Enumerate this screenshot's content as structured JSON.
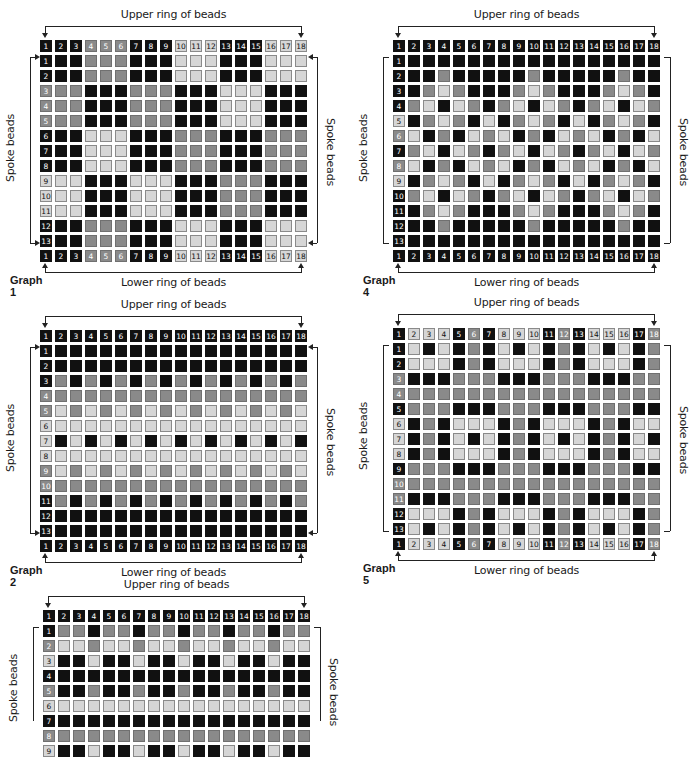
{
  "labels": {
    "upper": "Upper ring of beads",
    "lower": "Lower ring of beads",
    "spoke": "Spoke beads"
  },
  "colors": {
    "B": "#111111",
    "G": "#8a8a8a",
    "L": "#d6d6d6"
  },
  "graphs": [
    {
      "id": "graph1",
      "caption": "Graph 1",
      "x": 40,
      "y": 0,
      "style": "arrows",
      "header": "BBBGGGBBBLLLBBBLLL",
      "rows": [
        "BBBGGGBBBLLLBBBLLL",
        "BBBGGGBBBLLLBBBLLL",
        "GGGBBBGGGBBBLLLBBB",
        "GGGBBBGGGBBBLLLBBB",
        "GGGBBBGGGBBBLLLBBB",
        "BBBLLLBBBGGGBBBGGG",
        "BBBLLLBBBGGGBBBGGG",
        "BBBLLLBBBGGGBBBGGG",
        "LLLBBBLLLBBBGGGBBB",
        "LLLBBBLLLBBBGGGBBB",
        "LLLBBBLLLBBBGGGBBB",
        "BBBGGGBBBLLLBBBLLL",
        "BBBGGGBBBLLLBBBLLL"
      ],
      "footer": "BBBGGGBBBLLLBBBLLL"
    },
    {
      "id": "graph4",
      "caption": "Graph 4",
      "x": 393,
      "y": 0,
      "style": "brackets",
      "header": "BBBBBBBBBBBBBBBBBB",
      "rows": [
        "BBBBBBBBBBBBBBBBBB",
        "BBBGBBBBBGBBBBBGBB",
        "BBGLGBBBGLGBBBGLGB",
        "BGLBLGBGLBLGBGLBLG",
        "LBGLGBLBGLGBLBGLGB",
        "GLBGBLGLBGBLGLBGBL",
        "BGLBLGBGLBLGBGLBLG",
        "GLBGBLGLBGBLGLBGBL",
        "LBGLGBLBGLGBLBGLGB",
        "BGLBLGBGLBLGBGLBLG",
        "BBGLGBBBGLGBBBGLGB",
        "BBBGBBBBBGBBBBBGBB",
        "BBBBBBBBBBBBBBBBBB"
      ],
      "footer": "BBBBBBBBBBBBBBBBBB"
    },
    {
      "id": "graph2",
      "caption": "Graph 2",
      "x": 40,
      "y": 290,
      "style": "arrows",
      "header": "BBBBBBBBBBBBBBBBBB",
      "rows": [
        "BBBBBBBBBBBBBBBBBB",
        "BBBBBBBBBBBBBBBBBB",
        "BGBGBGBGBGBGBGBGBG",
        "GGGGGGGGGGGGGGGGGG",
        "GLGLGLGLGLGLGLGLGL",
        "LLLLLLLLLLLLLLLLLL",
        "LBLBLBLBLBLBLBLBLB",
        "LLLLLLLLLLLLLLLLLL",
        "GLGLGLGLGLGLGLGLGL",
        "GGGGGGGGGGGGGGGGGG",
        "BGBGBGBGBGBGBGBGBG",
        "BBBBBBBBBBBBBBBBBB",
        "BBBBBBBBBBBBBBBBBB"
      ],
      "footer": "BBBBBBBBBBBBBBBBBB"
    },
    {
      "id": "graph5",
      "caption": "Graph 5",
      "x": 393,
      "y": 288,
      "style": "brackets",
      "header": "BLLLBGBLLLBGBLLLBG",
      "rows": [
        "BLBLBGBLBLBGBLBLBG",
        "BLLLBGBLLLBGBLLLBG",
        "GBBBGGGBBBGGGBBBGG",
        "GGGGGGGGGGGGGGGGGG",
        "BGGGBBBGGGBBBGGGBB",
        "LBGBLLLBGBLLLBGBLL",
        "LBGBLBLBGBLBLBGBLB",
        "LBGBLLLBGBLLLBGBLL",
        "BGGGBBBGGGBBBGGGBB",
        "GGGGGGGGGGGGGGGGGG",
        "GBBBGGGBBBGGGBBBGG",
        "BLLLBGBLLLBGBLLLBG",
        "BLBLBGBLBLBGBLBLBG"
      ],
      "footer": "BLLLBGBLLLBGBLLLBG"
    },
    {
      "id": "graph6",
      "caption": "",
      "x": 43,
      "y": 570,
      "style": "brackets",
      "header": "BBBBBBBBBBBBBBBBBB",
      "rows": [
        "BGGBGGBGGBGGBGGBGG",
        "GLLGLLGLLGLLGLLGLL",
        "LBBLBBLBBLBBLBBLBB",
        "BBBBBBBBBBBBBBBBBB",
        "GBBGBBGBBGBBGBBGBB",
        "LLLLLLLLLLLLLLLLLL",
        "BBBBBBBBBBBBBBBBBB",
        "GGGGGGGGGGGGGGGGGG",
        "LBBLBBLBBLBBLBBLBB"
      ],
      "footer": null
    }
  ]
}
